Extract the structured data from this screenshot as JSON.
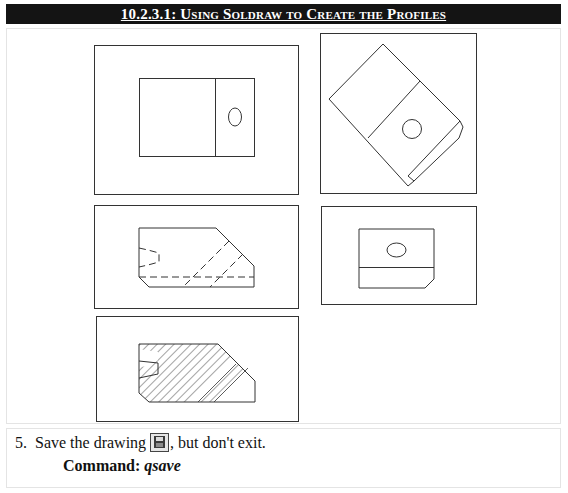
{
  "section": {
    "title": "10.2.3.1: Using Soldraw to Create the Profiles"
  },
  "figure": {
    "views": [
      {
        "name": "top-view",
        "description": "Plan view: rectangle with vertical dividing line and elliptical hole"
      },
      {
        "name": "auxiliary-view",
        "description": "Rotated isometric-style view with circular hole and chamfered end"
      },
      {
        "name": "front-view",
        "description": "Profile with chamfers, hidden (dashed) lines for slot and hole"
      },
      {
        "name": "side-view",
        "description": "Side profile with elliptical hole, horizontal line and chamfered corner"
      },
      {
        "name": "section-view",
        "description": "Hatched cross-section profile with V-notch"
      }
    ]
  },
  "step": {
    "number": "5.",
    "text_before": "Save the drawing",
    "icon": "save-icon",
    "text_after": ", but don't exit.",
    "command_label": "Command: ",
    "command_value": "qsave"
  },
  "colors": {
    "title_background": "#141414",
    "title_text": "#ffffff",
    "line": "#333333",
    "panel_border": "#e4e4e4"
  }
}
